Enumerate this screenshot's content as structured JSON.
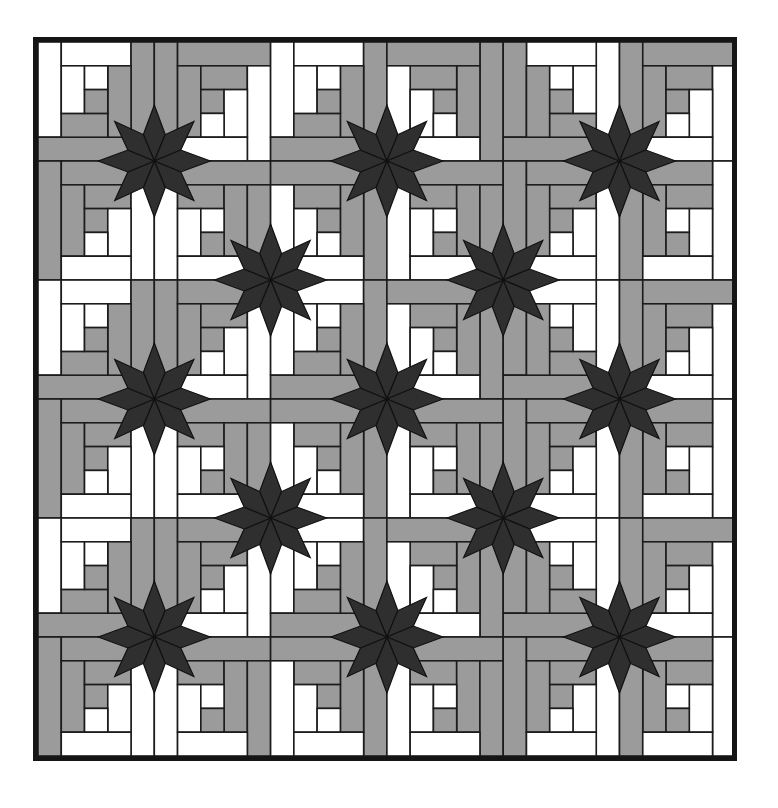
{
  "image": {
    "subject": "Log cabin quilt pattern with eight-pointed stars",
    "palette": {
      "background": "#ffffff",
      "light": "#ffffff",
      "medium": "#9b9b9b",
      "dark": "#2f2f2f",
      "line": "#1c1c1c",
      "frame": "#151515"
    }
  },
  "quilt": {
    "grid_blocks": [
      6,
      6
    ],
    "units_per_block": 5,
    "star_count": 13,
    "stars": [
      [
        1,
        1
      ],
      [
        3,
        1
      ],
      [
        5,
        1
      ],
      [
        2,
        2
      ],
      [
        4,
        2
      ],
      [
        1,
        3
      ],
      [
        3,
        3
      ],
      [
        5,
        3
      ],
      [
        2,
        4
      ],
      [
        4,
        4
      ],
      [
        1,
        5
      ],
      [
        3,
        5
      ],
      [
        5,
        5
      ]
    ],
    "blocks": [
      [
        "A",
        "B",
        "A",
        "Bm",
        "Am",
        "B"
      ],
      [
        "C",
        "D",
        "Cm",
        "D",
        "C",
        "Dm"
      ],
      [
        "A",
        "B",
        "A",
        "Bm",
        "Am",
        "B"
      ],
      [
        "C",
        "D",
        "Cm",
        "D",
        "C",
        "Dm"
      ],
      [
        "A",
        "B",
        "A",
        "Bm",
        "Am",
        "B"
      ],
      [
        "C",
        "D",
        "Cm",
        "D",
        "C",
        "Dm"
      ]
    ],
    "block_defs": {
      "A": [
        [
          0,
          0,
          1,
          4,
          "W"
        ],
        [
          1,
          0,
          3,
          1,
          "W"
        ],
        [
          4,
          0,
          1,
          4,
          "G"
        ],
        [
          0,
          4,
          5,
          1,
          "G"
        ],
        [
          3,
          1,
          1,
          3,
          "G"
        ],
        [
          1,
          3,
          2,
          1,
          "G"
        ],
        [
          1,
          1,
          1,
          2,
          "W"
        ],
        [
          2,
          1,
          1,
          1,
          "W"
        ],
        [
          2,
          2,
          1,
          1,
          "G"
        ]
      ],
      "B": [
        [
          0,
          0,
          1,
          5,
          "G"
        ],
        [
          1,
          0,
          4,
          1,
          "G"
        ],
        [
          1,
          1,
          1,
          3,
          "G"
        ],
        [
          2,
          1,
          2,
          1,
          "G"
        ],
        [
          4,
          1,
          1,
          4,
          "W"
        ],
        [
          2,
          2,
          1,
          1,
          "G"
        ],
        [
          3,
          2,
          1,
          2,
          "W"
        ],
        [
          2,
          3,
          1,
          1,
          "W"
        ],
        [
          1,
          4,
          3,
          1,
          "W"
        ]
      ],
      "C": [
        [
          0,
          0,
          1,
          5,
          "G"
        ],
        [
          1,
          0,
          4,
          1,
          "G"
        ],
        [
          1,
          1,
          1,
          3,
          "G"
        ],
        [
          2,
          1,
          2,
          1,
          "G"
        ],
        [
          4,
          1,
          1,
          4,
          "W"
        ],
        [
          2,
          2,
          1,
          1,
          "G"
        ],
        [
          3,
          2,
          1,
          2,
          "W"
        ],
        [
          2,
          3,
          1,
          1,
          "W"
        ],
        [
          1,
          4,
          3,
          1,
          "W"
        ]
      ],
      "D": [
        [
          0,
          0,
          1,
          5,
          "W"
        ],
        [
          1,
          0,
          4,
          1,
          "G"
        ],
        [
          1,
          1,
          2,
          1,
          "G"
        ],
        [
          3,
          1,
          1,
          3,
          "G"
        ],
        [
          4,
          1,
          1,
          4,
          "G"
        ],
        [
          1,
          2,
          1,
          2,
          "W"
        ],
        [
          2,
          2,
          1,
          1,
          "W"
        ],
        [
          2,
          3,
          1,
          1,
          "G"
        ],
        [
          1,
          4,
          3,
          1,
          "W"
        ]
      ]
    }
  }
}
